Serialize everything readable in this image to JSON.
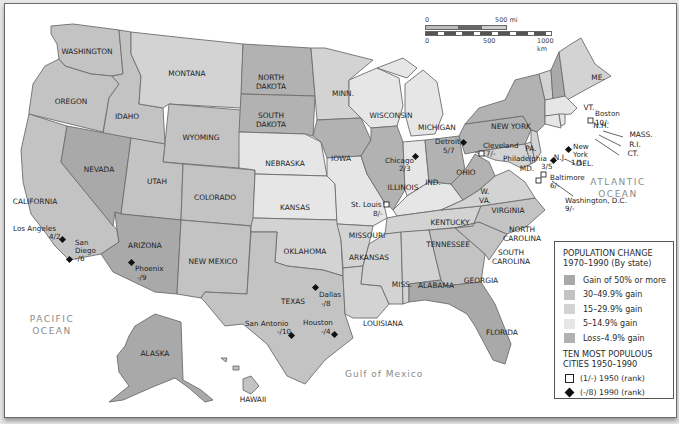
{
  "map": {
    "type": "choropleth",
    "title": "Population Change 1970–1990 (By state)",
    "colors": {
      "gain_50_plus": "#a9a9a9",
      "gain_30_49": "#c3c3c3",
      "gain_15_29": "#d3d3d3",
      "gain_5_14": "#e6e6e6",
      "loss_4_9": "#b2b2b2",
      "water": "#ffffff",
      "border": "#6d6d6d"
    },
    "oceans": {
      "pacific": [
        "PACIFIC",
        "OCEAN"
      ],
      "atlantic": [
        "ATLANTIC",
        "OCEAN"
      ],
      "gulf": "Gulf of Mexico"
    },
    "states": {
      "wa": "WASHINGTON",
      "or": "OREGON",
      "ca": "CALIFORNIA",
      "id": "IDAHO",
      "nv": "NEVADA",
      "mt": "MONTANA",
      "wy": "WYOMING",
      "ut": "UTAH",
      "co": "COLORADO",
      "az": "ARIZONA",
      "nm": "NEW MEXICO",
      "nd": [
        "NORTH",
        "DAKOTA"
      ],
      "sd": [
        "SOUTH",
        "DAKOTA"
      ],
      "ne": "NEBRASKA",
      "ks": "KANSAS",
      "ok": "OKLAHOMA",
      "tx": "TEXAS",
      "mn": "MINN.",
      "ia": "IOWA",
      "mo": "MISSOURI",
      "ar": "ARKANSAS",
      "la": "LOUISIANA",
      "wi": "WISCONSIN",
      "il": "ILLINOIS",
      "mi": "MICHIGAN",
      "in": "IND.",
      "oh": "OHIO",
      "ky": "KENTUCKY",
      "tn": "TENNESSEE",
      "ms": "MISS.",
      "al": "ALABAMA",
      "ga": "GEORGIA",
      "fl": "FLORIDA",
      "sc": [
        "SOUTH",
        "CAROLINA"
      ],
      "nc": [
        "NORTH",
        "CAROLINA"
      ],
      "va": "VIRGINIA",
      "wv": [
        "W.",
        "VA."
      ],
      "md": "MD.",
      "de": "DEL.",
      "nj": "N.J.",
      "pa": "PA.",
      "ny": "NEW YORK",
      "vt": "VT.",
      "nh": "N.H.",
      "me": "ME.",
      "ma": "MASS.",
      "ri": "R.I.",
      "ct": "CT.",
      "ak": "ALASKA",
      "hi": "HAWAII"
    },
    "state_categories": {
      "gain_50_plus": [
        "NV",
        "AZ",
        "FL",
        "AK"
      ],
      "gain_30_49": [
        "WA",
        "OR",
        "CA",
        "ID",
        "UT",
        "CO",
        "NM",
        "TX",
        "WY",
        "GA",
        "NH",
        "HI",
        "SC",
        "NC"
      ],
      "gain_15_29": [
        "MT",
        "OK",
        "ME",
        "VT",
        "VA",
        "AR",
        "MS",
        "AL",
        "TN",
        "MN",
        "LA",
        "DE",
        "MD",
        "NJ"
      ],
      "gain_5_14": [
        "NE",
        "KS",
        "MO",
        "WI",
        "IN",
        "KY",
        "MI",
        "MA",
        "CT",
        "RI"
      ],
      "loss_4_9": [
        "ND",
        "SD",
        "IA",
        "IL",
        "OH",
        "PA",
        "NY",
        "WV"
      ]
    },
    "cities": [
      {
        "name": "Los Angeles",
        "rank": "4/2",
        "symbol": "diamond"
      },
      {
        "name": "San Diego",
        "rank": "-/6",
        "symbol": "diamond"
      },
      {
        "name": "Phoenix",
        "rank": "-/9",
        "symbol": "diamond"
      },
      {
        "name": "Dallas",
        "rank": "-/8",
        "symbol": "diamond"
      },
      {
        "name": "San Antonio",
        "rank": "-/10",
        "symbol": "diamond"
      },
      {
        "name": "Houston",
        "rank": "-/4",
        "symbol": "diamond"
      },
      {
        "name": "St. Louis",
        "rank": "8/-",
        "symbol": "square"
      },
      {
        "name": "Chicago",
        "rank": "2/3",
        "symbol": "diamond"
      },
      {
        "name": "Detroit",
        "rank": "5/7",
        "symbol": "diamond"
      },
      {
        "name": "Cleveland",
        "rank": "7/-",
        "symbol": "square"
      },
      {
        "name": "Philadelphia",
        "rank": "3/5",
        "symbol": "diamond"
      },
      {
        "name": "Baltimore",
        "rank": "6/-",
        "symbol": "square"
      },
      {
        "name": "Washington, D.C.",
        "rank": "9/-",
        "symbol": "square"
      },
      {
        "name": "New York",
        "rank": "1/1",
        "symbol": "diamond"
      },
      {
        "name": "Boston",
        "rank": "10/-",
        "symbol": "square"
      }
    ]
  },
  "scale": {
    "mi_start": "0",
    "mi_end": "500 mi",
    "km_start": "0",
    "km_mid": "500",
    "km_end": "1000 km"
  },
  "legend": {
    "title_line1": "POPULATION CHANGE",
    "title_line2": "1970–1990 (By state)",
    "items": [
      {
        "label": "Gain of 50% or more",
        "color": "#a9a9a9"
      },
      {
        "label": "30–49.9% gain",
        "color": "#c3c3c3"
      },
      {
        "label": "15–29.9% gain",
        "color": "#d3d3d3"
      },
      {
        "label": "5–14.9% gain",
        "color": "#e6e6e6"
      },
      {
        "label": "Loss–4.9% gain",
        "color": "#b2b2b2"
      }
    ],
    "cities_title_line1": "TEN MOST POPULOUS",
    "cities_title_line2": "CITIES 1950–1990",
    "sym_1950": "(1/-) 1950 (rank)",
    "sym_1990": "(-/8) 1990 (rank)"
  }
}
